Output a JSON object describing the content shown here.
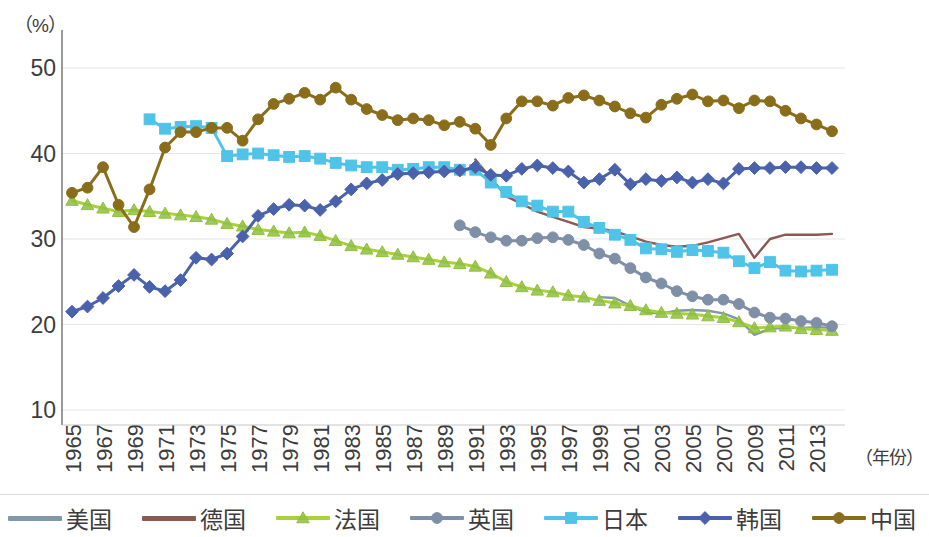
{
  "axes": {
    "unit_label": "（%）",
    "xaxis_title": "（年份）",
    "y_ticks": [
      "50",
      "40",
      "30",
      "20",
      "10"
    ],
    "y_tick_values": [
      50,
      40,
      30,
      20,
      10
    ],
    "x_ticks": [
      "1965",
      "1967",
      "1969",
      "1971",
      "1973",
      "1975",
      "1977",
      "1979",
      "1981",
      "1983",
      "1985",
      "1987",
      "1989",
      "1991",
      "1993",
      "1995",
      "1997",
      "1999",
      "2001",
      "2003",
      "2005",
      "2007",
      "2009",
      "2011",
      "2013"
    ]
  },
  "legend": {
    "items": [
      {
        "label": "美国",
        "color": "#8099aa",
        "marker": "none"
      },
      {
        "label": "德国",
        "color": "#8a5a52",
        "marker": "none"
      },
      {
        "label": "法国",
        "color": "#a9d13a",
        "marker": "triangle"
      },
      {
        "label": "英国",
        "color": "#7e8fa6",
        "marker": "circle"
      },
      {
        "label": "日本",
        "color": "#4fc3e8",
        "marker": "square"
      },
      {
        "label": "韩国",
        "color": "#4a61ab",
        "marker": "diamond"
      },
      {
        "label": "中国",
        "color": "#8a6d1b",
        "marker": "circle"
      }
    ]
  },
  "chart_data": {
    "type": "line",
    "title": "",
    "xlabel": "（年份）",
    "ylabel": "（%）",
    "ylim": [
      8,
      52
    ],
    "xlim": [
      1965,
      2014
    ],
    "grid": true,
    "legend_position": "bottom",
    "x": [
      1965,
      1966,
      1967,
      1968,
      1969,
      1970,
      1971,
      1972,
      1973,
      1974,
      1975,
      1976,
      1977,
      1978,
      1979,
      1980,
      1981,
      1982,
      1983,
      1984,
      1985,
      1986,
      1987,
      1988,
      1989,
      1990,
      1991,
      1992,
      1993,
      1994,
      1995,
      1996,
      1997,
      1998,
      1999,
      2000,
      2001,
      2002,
      2003,
      2004,
      2005,
      2006,
      2007,
      2008,
      2009,
      2010,
      2011,
      2012,
      2013,
      2014
    ],
    "series": [
      {
        "name": "美国",
        "color": "#8099aa",
        "marker": "none",
        "x_start": 1999,
        "values": [
          null,
          null,
          null,
          null,
          null,
          null,
          null,
          null,
          null,
          null,
          null,
          null,
          null,
          null,
          null,
          null,
          null,
          null,
          null,
          null,
          null,
          null,
          null,
          null,
          null,
          null,
          null,
          null,
          null,
          null,
          null,
          null,
          null,
          null,
          23.2,
          23.1,
          22.2,
          21.4,
          21.3,
          21.6,
          21.7,
          21.6,
          21.3,
          20.6,
          18.8,
          19.5,
          19.6,
          19.6,
          19.7,
          19.6
        ]
      },
      {
        "name": "德国",
        "color": "#8a5a52",
        "marker": "none",
        "x_start": 1991,
        "values": [
          null,
          null,
          null,
          null,
          null,
          null,
          null,
          null,
          null,
          null,
          null,
          null,
          null,
          null,
          null,
          null,
          null,
          null,
          null,
          null,
          null,
          null,
          null,
          null,
          null,
          null,
          39.3,
          37.1,
          35.0,
          34.1,
          33.2,
          32.6,
          32.0,
          31.4,
          31.2,
          30.9,
          30.3,
          29.7,
          29.3,
          29.1,
          29.2,
          29.6,
          30.1,
          30.6,
          27.8,
          30.0,
          30.5,
          30.5,
          30.5,
          30.6
        ]
      },
      {
        "name": "法国",
        "color": "#a9d13a",
        "marker": "triangle",
        "x_start": 1965,
        "values": [
          34.5,
          34.0,
          33.6,
          33.2,
          33.4,
          33.2,
          33.0,
          32.8,
          32.6,
          32.3,
          31.8,
          31.5,
          31.1,
          30.9,
          30.7,
          30.8,
          30.4,
          29.8,
          29.2,
          28.8,
          28.5,
          28.2,
          27.9,
          27.6,
          27.3,
          27.1,
          26.8,
          26.0,
          25.0,
          24.4,
          24.0,
          23.8,
          23.4,
          23.2,
          22.8,
          22.5,
          22.2,
          21.7,
          21.4,
          21.3,
          21.2,
          21.0,
          20.8,
          20.3,
          19.6,
          19.7,
          19.8,
          19.5,
          19.4,
          19.3
        ]
      },
      {
        "name": "英国",
        "color": "#7e8fa6",
        "marker": "circle",
        "x_start": 1990,
        "values": [
          null,
          null,
          null,
          null,
          null,
          null,
          null,
          null,
          null,
          null,
          null,
          null,
          null,
          null,
          null,
          null,
          null,
          null,
          null,
          null,
          null,
          null,
          null,
          null,
          null,
          31.6,
          30.8,
          30.2,
          29.8,
          29.8,
          30.1,
          30.2,
          29.9,
          29.3,
          28.3,
          27.7,
          26.6,
          25.5,
          24.8,
          23.9,
          23.3,
          22.9,
          22.9,
          22.4,
          21.4,
          20.8,
          20.7,
          20.4,
          20.2,
          19.8
        ]
      },
      {
        "name": "日本",
        "color": "#4fc3e8",
        "marker": "square",
        "x_start": 1970,
        "values": [
          null,
          null,
          null,
          null,
          null,
          44.0,
          42.9,
          43.1,
          43.2,
          43.0,
          39.7,
          39.9,
          40.0,
          39.8,
          39.6,
          39.7,
          39.4,
          38.9,
          38.6,
          38.4,
          38.4,
          38.1,
          38.2,
          38.4,
          38.4,
          38.1,
          38.1,
          36.6,
          35.5,
          34.4,
          33.9,
          33.2,
          33.2,
          32.0,
          31.3,
          30.5,
          29.9,
          28.9,
          28.8,
          28.5,
          28.7,
          28.6,
          28.4,
          27.4,
          26.6,
          27.3,
          26.3,
          26.2,
          26.3,
          26.4
        ]
      },
      {
        "name": "韩国",
        "color": "#4a61ab",
        "marker": "diamond",
        "x_start": 1965,
        "values": [
          21.5,
          22.1,
          23.1,
          24.5,
          25.8,
          24.4,
          23.9,
          25.2,
          27.8,
          27.6,
          28.3,
          30.3,
          32.7,
          33.5,
          34.0,
          33.9,
          33.4,
          34.4,
          35.8,
          36.5,
          36.9,
          37.6,
          37.7,
          37.8,
          37.9,
          38.0,
          38.4,
          37.5,
          37.4,
          38.2,
          38.6,
          38.3,
          37.9,
          36.6,
          37.0,
          38.1,
          36.4,
          37.0,
          36.8,
          37.2,
          36.6,
          37.0,
          36.5,
          38.2,
          38.3,
          38.3,
          38.4,
          38.4,
          38.3,
          38.3
        ]
      },
      {
        "name": "中国",
        "color": "#8a6d1b",
        "marker": "circle",
        "x_start": 1965,
        "values": [
          35.4,
          36.0,
          38.4,
          34.0,
          31.4,
          35.8,
          40.7,
          42.5,
          42.5,
          43.0,
          43.0,
          41.5,
          44.0,
          45.8,
          46.4,
          47.1,
          46.3,
          47.7,
          46.3,
          45.2,
          44.5,
          43.9,
          44.1,
          43.9,
          43.3,
          43.7,
          42.9,
          41.0,
          44.1,
          46.1,
          46.1,
          45.6,
          46.5,
          46.8,
          46.2,
          45.5,
          44.7,
          44.2,
          45.7,
          46.4,
          46.9,
          46.1,
          46.2,
          45.3,
          46.2,
          46.1,
          45.0,
          44.1,
          43.4,
          42.6
        ]
      }
    ]
  }
}
